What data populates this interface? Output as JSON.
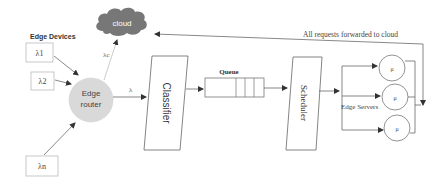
{
  "edge_devices": {
    "heading": "Edge Devices",
    "devices": [
      {
        "label": "λ1"
      },
      {
        "label": "λ2"
      },
      {
        "label": "λn"
      }
    ]
  },
  "cloud": {
    "label": "cloud",
    "color": "#777777"
  },
  "edge_router": {
    "line1": "Edge",
    "line2": "router",
    "color": "#d9d9d9"
  },
  "rates": {
    "to_cloud": "λc",
    "to_classifier": "λ"
  },
  "classifier": {
    "label": "Classifier"
  },
  "queue": {
    "label": "Queue"
  },
  "scheduler": {
    "label": "Scheduler"
  },
  "edge_servers": {
    "label": "Edge Servers",
    "servers": [
      {
        "label": "μ"
      },
      {
        "label": "μ"
      },
      {
        "label": "μ"
      }
    ]
  },
  "feedback": {
    "label": "All requests forwarded to cloud"
  }
}
